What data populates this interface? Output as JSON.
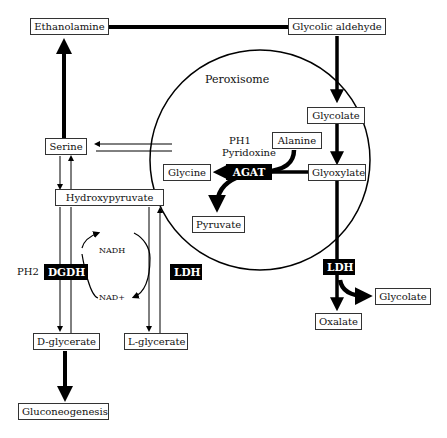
{
  "compartment": {
    "label": "Peroxisome"
  },
  "metabolites": {
    "ethanolamine": "Ethanolamine",
    "glycolic_aldehyde": "Glycolic aldehyde",
    "glycolate_perox": "Glycolate",
    "alanine": "Alanine",
    "glycine": "Glycine",
    "glyoxylate": "Glyoxylate",
    "pyruvate": "Pyruvate",
    "serine": "Serine",
    "hydroxypyruvate": "Hydroxypyruvate",
    "d_glycerate": "D-glycerate",
    "l_glycerate": "L-glycerate",
    "gluconeogenesis": "Gluconeogenesis",
    "oxalate": "Oxalate",
    "glycolate_cyto": "Glycolate"
  },
  "enzymes": {
    "agat": "AGAT",
    "dgdh": "DGDH",
    "ldh_left": "LDH",
    "ldh_right": "LDH"
  },
  "annotations": {
    "ph1": "PH1",
    "pyridoxine": "Pyridoxine",
    "ph2": "PH2",
    "nadh": "NADH",
    "nad_plus": "NAD+"
  }
}
